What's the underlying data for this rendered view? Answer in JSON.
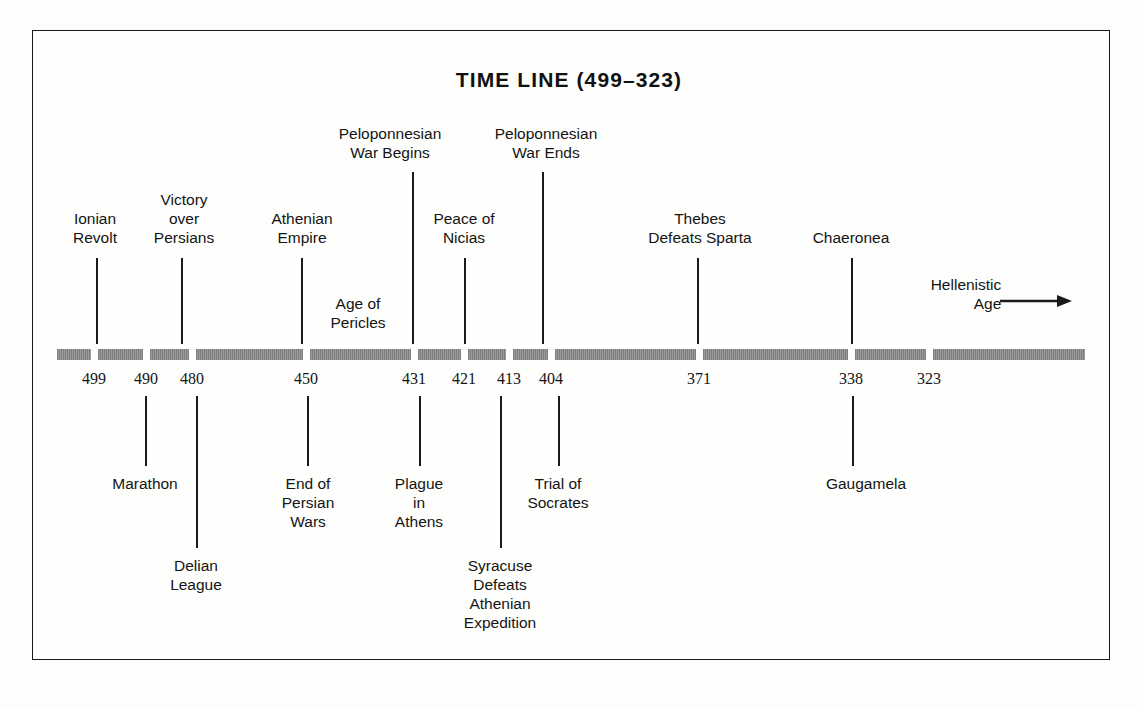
{
  "document": {
    "title": "TIME LINE (499–323)",
    "kind": "historical-timeline"
  },
  "colors": {
    "ink": "#1a1a1a",
    "bar": "#8a8a8a",
    "background": "#fdfdfc",
    "frame": "#1a1a1a"
  },
  "timeline": {
    "bar": {
      "x_start": 57,
      "x_end": 1085,
      "y": 349,
      "thickness": 11,
      "gap": 7
    },
    "dates": [
      {
        "label": "499",
        "x": 94
      },
      {
        "label": "490",
        "x": 146
      },
      {
        "label": "480",
        "x": 192
      },
      {
        "label": "450",
        "x": 306
      },
      {
        "label": "431",
        "x": 414
      },
      {
        "label": "421",
        "x": 464
      },
      {
        "label": "413",
        "x": 509
      },
      {
        "label": "404",
        "x": 551
      },
      {
        "label": "371",
        "x": 699
      },
      {
        "label": "338",
        "x": 851
      },
      {
        "label": "323",
        "x": 929
      }
    ],
    "events_above": [
      {
        "name": "ionian-revolt",
        "lines": [
          "Ionian",
          "Revolt"
        ],
        "label_x": 95,
        "label_top": 209,
        "line_x": 96,
        "line_top": 258,
        "line_height": 86
      },
      {
        "name": "victory-over-persians",
        "lines": [
          "Victory",
          "over",
          "Persians"
        ],
        "label_x": 184,
        "label_top": 190,
        "line_x": 181,
        "line_top": 258,
        "line_height": 86
      },
      {
        "name": "athenian-empire",
        "lines": [
          "Athenian",
          "Empire"
        ],
        "label_x": 302,
        "label_top": 209,
        "line_x": 301,
        "line_top": 258,
        "line_height": 86
      },
      {
        "name": "age-of-pericles",
        "lines": [
          "Age of",
          "Pericles"
        ],
        "label_x": 358,
        "label_top": 294,
        "line_x": null,
        "line_top": null,
        "line_height": 0
      },
      {
        "name": "peloponnesian-war-begins",
        "lines": [
          "Peloponnesian",
          "War Begins"
        ],
        "label_x": 390,
        "label_top": 124,
        "line_x": 412,
        "line_top": 172,
        "line_height": 172
      },
      {
        "name": "peace-of-nicias",
        "lines": [
          "Peace of",
          "Nicias"
        ],
        "label_x": 464,
        "label_top": 209,
        "line_x": 464,
        "line_top": 258,
        "line_height": 86
      },
      {
        "name": "peloponnesian-war-ends",
        "lines": [
          "Peloponnesian",
          "War Ends"
        ],
        "label_x": 546,
        "label_top": 124,
        "line_x": 542,
        "line_top": 172,
        "line_height": 172
      },
      {
        "name": "thebes-defeats-sparta",
        "lines": [
          "Thebes",
          "Defeats Sparta"
        ],
        "label_x": 700,
        "label_top": 209,
        "line_x": 697,
        "line_top": 258,
        "line_height": 86
      },
      {
        "name": "chaeronea",
        "lines": [
          "Chaeronea"
        ],
        "label_x": 851,
        "label_top": 228,
        "line_x": 851,
        "line_top": 258,
        "line_height": 86
      }
    ],
    "events_below": [
      {
        "name": "marathon",
        "lines": [
          "Marathon"
        ],
        "label_x": 145,
        "label_top": 474,
        "line_x": 145,
        "line_top": 396,
        "line_height": 70
      },
      {
        "name": "delian-league",
        "lines": [
          "Delian",
          "League"
        ],
        "label_x": 196,
        "label_top": 556,
        "line_x": 196,
        "line_top": 396,
        "line_height": 152
      },
      {
        "name": "end-of-persian-wars",
        "lines": [
          "End of",
          "Persian",
          "Wars"
        ],
        "label_x": 308,
        "label_top": 474,
        "line_x": 307,
        "line_top": 396,
        "line_height": 70
      },
      {
        "name": "plague-in-athens",
        "lines": [
          "Plague",
          "in",
          "Athens"
        ],
        "label_x": 419,
        "label_top": 474,
        "line_x": 419,
        "line_top": 396,
        "line_height": 70
      },
      {
        "name": "syracuse-defeats-athenian-expedition",
        "lines": [
          "Syracuse",
          "Defeats",
          "Athenian",
          "Expedition"
        ],
        "label_x": 500,
        "label_top": 556,
        "line_x": 500,
        "line_top": 396,
        "line_height": 152
      },
      {
        "name": "trial-of-socrates",
        "lines": [
          "Trial of",
          "Socrates"
        ],
        "label_x": 558,
        "label_top": 474,
        "line_x": 558,
        "line_top": 396,
        "line_height": 70
      },
      {
        "name": "gaugamela",
        "lines": [
          "Gaugamela"
        ],
        "label_x": 866,
        "label_top": 474,
        "line_x": 852,
        "line_top": 396,
        "line_height": 70
      }
    ],
    "era": {
      "name": "hellenistic-age",
      "lines": [
        "Hellenistic",
        "Age"
      ],
      "label_x": 966,
      "label_top": 275,
      "arrow": {
        "x": 1000,
        "y": 301,
        "length": 72,
        "direction": "right"
      }
    }
  }
}
